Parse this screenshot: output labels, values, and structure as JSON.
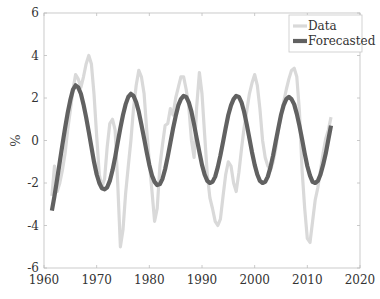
{
  "chart_data": {
    "type": "line",
    "title": "",
    "xlabel": "",
    "ylabel": "%",
    "xlim": [
      1960,
      2020
    ],
    "ylim": [
      -6,
      6
    ],
    "xticks": [
      1960,
      1970,
      1980,
      1990,
      2000,
      2010,
      2020
    ],
    "yticks": [
      -6,
      -4,
      -2,
      0,
      2,
      4,
      6
    ],
    "grid": false,
    "legend_position": "upper right",
    "legend": [
      "Data",
      "Forecasted"
    ],
    "series": [
      {
        "name": "Data",
        "color": "#d9d9d9",
        "x": [
          1961.5,
          1962,
          1962.5,
          1963,
          1963.5,
          1964,
          1964.5,
          1965,
          1965.5,
          1966,
          1966.5,
          1967,
          1967.5,
          1968,
          1968.5,
          1969,
          1969.5,
          1970,
          1970.5,
          1971,
          1971.5,
          1972,
          1972.5,
          1973,
          1973.5,
          1974,
          1974.5,
          1975,
          1975.5,
          1976,
          1976.5,
          1977,
          1977.5,
          1978,
          1978.5,
          1979,
          1979.5,
          1980,
          1980.5,
          1981,
          1981.5,
          1982,
          1982.5,
          1983,
          1983.5,
          1984,
          1984.5,
          1985,
          1985.5,
          1986,
          1986.5,
          1987,
          1987.5,
          1988,
          1988.5,
          1989,
          1989.5,
          1990,
          1990.5,
          1991,
          1991.5,
          1992,
          1992.5,
          1993,
          1993.5,
          1994,
          1994.5,
          1995,
          1995.5,
          1996,
          1996.5,
          1997,
          1997.5,
          1998,
          1998.5,
          1999,
          1999.5,
          2000,
          2000.5,
          2001,
          2001.5,
          2002,
          2002.5,
          2003,
          2003.5,
          2004,
          2004.5,
          2005,
          2005.5,
          2006,
          2006.5,
          2007,
          2007.5,
          2008,
          2008.5,
          2009,
          2009.5,
          2010,
          2010.5,
          2011,
          2011.5,
          2012,
          2012.5,
          2013,
          2013.5,
          2014,
          2014.5
        ],
        "values": [
          -2.6,
          -1.2,
          -2.4,
          -2.0,
          -1.4,
          -0.6,
          0.5,
          1.4,
          2.4,
          3.1,
          2.9,
          2.5,
          3.0,
          3.6,
          4.0,
          3.6,
          2.2,
          0.2,
          -1.6,
          -2.2,
          -1.8,
          -0.3,
          0.8,
          1.0,
          0.5,
          -2.0,
          -5.0,
          -4.2,
          -2.5,
          -1.2,
          0.0,
          1.5,
          2.6,
          3.3,
          3.0,
          2.2,
          0.5,
          -1.0,
          -2.4,
          -3.8,
          -3.2,
          -1.2,
          -0.2,
          0.7,
          0.8,
          1.5,
          1.2,
          2.0,
          2.5,
          3.0,
          3.0,
          2.4,
          1.6,
          0.0,
          -0.8,
          1.6,
          3.2,
          2.2,
          0.3,
          -1.6,
          -2.7,
          -3.2,
          -3.8,
          -4.0,
          -3.7,
          -2.6,
          -1.6,
          -1.0,
          -1.2,
          -2.0,
          -2.4,
          -1.5,
          -0.4,
          0.6,
          1.4,
          2.2,
          2.7,
          3.1,
          2.6,
          1.5,
          0.0,
          -0.8,
          -1.2,
          -1.4,
          -1.0,
          -0.4,
          0.5,
          1.2,
          1.8,
          2.4,
          2.9,
          3.3,
          3.4,
          3.0,
          1.4,
          -1.4,
          -3.2,
          -4.6,
          -4.8,
          -3.8,
          -2.8,
          -2.2,
          -1.4,
          -0.6,
          0.1,
          0.5,
          1.1
        ]
      },
      {
        "name": "Forecasted",
        "color": "#616161",
        "x": [
          1961.5,
          1962,
          1962.5,
          1963,
          1963.5,
          1964,
          1964.5,
          1965,
          1965.5,
          1966,
          1966.5,
          1967,
          1967.5,
          1968,
          1968.5,
          1969,
          1969.5,
          1970,
          1970.5,
          1971,
          1971.5,
          1972,
          1972.5,
          1973,
          1973.5,
          1974,
          1974.5,
          1975,
          1975.5,
          1976,
          1976.5,
          1977,
          1977.5,
          1978,
          1978.5,
          1979,
          1979.5,
          1980,
          1980.5,
          1981,
          1981.5,
          1982,
          1982.5,
          1983,
          1983.5,
          1984,
          1984.5,
          1985,
          1985.5,
          1986,
          1986.5,
          1987,
          1987.5,
          1988,
          1988.5,
          1989,
          1989.5,
          1990,
          1990.5,
          1991,
          1991.5,
          1992,
          1992.5,
          1993,
          1993.5,
          1994,
          1994.5,
          1995,
          1995.5,
          1996,
          1996.5,
          1997,
          1997.5,
          1998,
          1998.5,
          1999,
          1999.5,
          2000,
          2000.5,
          2001,
          2001.5,
          2002,
          2002.5,
          2003,
          2003.5,
          2004,
          2004.5,
          2005,
          2005.5,
          2006,
          2006.5,
          2007,
          2007.5,
          2008,
          2008.5,
          2009,
          2009.5,
          2010,
          2010.5,
          2011,
          2011.5,
          2012,
          2012.5,
          2013,
          2013.5,
          2014,
          2014.5
        ],
        "values": [
          -3.3,
          -2.6,
          -1.8,
          -1.0,
          -0.2,
          0.6,
          1.3,
          1.9,
          2.4,
          2.6,
          2.5,
          2.2,
          1.7,
          1.1,
          0.4,
          -0.3,
          -1.0,
          -1.6,
          -2.0,
          -2.25,
          -2.3,
          -2.2,
          -1.9,
          -1.4,
          -0.8,
          -0.1,
          0.6,
          1.2,
          1.7,
          2.05,
          2.2,
          2.1,
          1.8,
          1.35,
          0.75,
          0.1,
          -0.55,
          -1.15,
          -1.65,
          -1.95,
          -2.1,
          -2.05,
          -1.8,
          -1.35,
          -0.75,
          -0.1,
          0.55,
          1.15,
          1.65,
          1.95,
          2.1,
          2.05,
          1.8,
          1.35,
          0.75,
          0.1,
          -0.55,
          -1.15,
          -1.6,
          -1.9,
          -2.0,
          -1.95,
          -1.7,
          -1.25,
          -0.7,
          -0.05,
          0.6,
          1.2,
          1.65,
          1.95,
          2.1,
          2.05,
          1.8,
          1.35,
          0.75,
          0.1,
          -0.55,
          -1.15,
          -1.6,
          -1.9,
          -2.0,
          -1.95,
          -1.7,
          -1.25,
          -0.7,
          -0.05,
          0.6,
          1.2,
          1.65,
          1.95,
          2.05,
          1.95,
          1.7,
          1.25,
          0.7,
          0.05,
          -0.6,
          -1.2,
          -1.65,
          -1.95,
          -2.0,
          -1.9,
          -1.6,
          -1.15,
          -0.6,
          0.05,
          0.7
        ]
      }
    ]
  }
}
